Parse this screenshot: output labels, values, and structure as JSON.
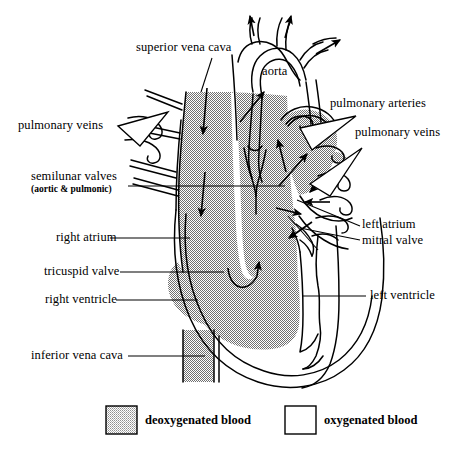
{
  "diagram": {
    "background_color": "#ffffff",
    "stroke_color": "#000000",
    "deoxygenated_fill": "#a8a8a8",
    "oxygenated_fill": "#ffffff",
    "legend_swatch_fill": "#bdbdbd"
  },
  "labels": {
    "superior_vena_cava": "superior vena cava",
    "aorta": "aorta",
    "pulmonary_arteries": "pulmonary arteries",
    "pulmonary_veins_right": "pulmonary veins",
    "pulmonary_veins_left": "pulmonary veins",
    "semilunar_valves": "semilunar valves",
    "semilunar_valves_sub": "(aortic & pulmonic)",
    "left_atrium": "left atrium",
    "mitral_valve": "mitral valve",
    "right_atrium": "right atrium",
    "tricuspid_valve": "tricuspid valve",
    "right_ventricle": "right ventricle",
    "left_ventricle": "left ventricle",
    "inferior_vena_cava": "inferior vena cava"
  },
  "legend": {
    "items": [
      {
        "label": "deoxygenated blood",
        "fill": "#bdbdbd",
        "border": "#000000"
      },
      {
        "label": "oxygenated blood",
        "fill": "#ffffff",
        "border": "#000000"
      }
    ]
  },
  "flow_arrows": [
    {
      "name": "svc-downward-upper",
      "direction": "down"
    },
    {
      "name": "svc-downward-lower",
      "direction": "down"
    },
    {
      "name": "aortic-arch-branch-1",
      "direction": "up"
    },
    {
      "name": "aortic-arch-branch-2",
      "direction": "up"
    },
    {
      "name": "aortic-arch-branch-3",
      "direction": "up-right"
    },
    {
      "name": "ascending-aorta",
      "direction": "up-right"
    },
    {
      "name": "pulmonary-artery-left",
      "direction": "up"
    },
    {
      "name": "pulmonary-artery-right",
      "direction": "up-right"
    },
    {
      "name": "tricuspid-flow",
      "direction": "curved-up"
    },
    {
      "name": "pulmonary-vein-inflow-1",
      "direction": "down-left"
    },
    {
      "name": "pulmonary-vein-inflow-2",
      "direction": "left"
    },
    {
      "name": "left-atrium-outflow",
      "direction": "right"
    },
    {
      "name": "mitral-flow",
      "direction": "down-left"
    }
  ]
}
